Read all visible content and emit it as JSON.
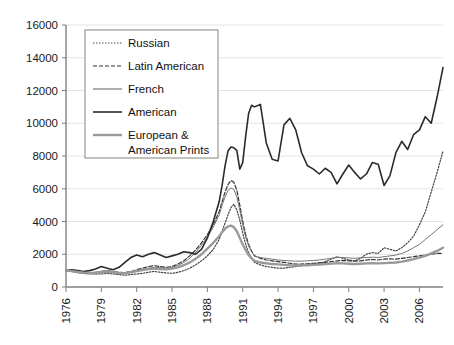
{
  "chart_data": {
    "type": "line",
    "title": "",
    "xlabel": "",
    "ylabel": "",
    "xlim": [
      1976,
      2008
    ],
    "ylim": [
      0,
      16000
    ],
    "grid": true,
    "legend_position": "top-left inside plot",
    "x_ticks": [
      "1976",
      "1979",
      "1982",
      "1985",
      "1988",
      "1991",
      "1994",
      "1997",
      "2000",
      "2003",
      "2006"
    ],
    "y_ticks": [
      "0",
      "2000",
      "4000",
      "6000",
      "8000",
      "10000",
      "12000",
      "14000",
      "16000"
    ],
    "x": [
      1976,
      1976.5,
      1977,
      1977.5,
      1978,
      1978.5,
      1979,
      1979.5,
      1980,
      1980.5,
      1981,
      1981.5,
      1982,
      1982.5,
      1983,
      1983.5,
      1984,
      1984.5,
      1985,
      1985.5,
      1986,
      1986.5,
      1987,
      1987.5,
      1988,
      1988.5,
      1989,
      1989.25,
      1989.5,
      1989.75,
      1990,
      1990.25,
      1990.5,
      1990.75,
      1991,
      1991.25,
      1991.5,
      1991.75,
      1992,
      1992.5,
      1993,
      1993.5,
      1994,
      1994.5,
      1995,
      1995.5,
      1996,
      1996.5,
      1997,
      1997.5,
      1998,
      1998.5,
      1999,
      1999.5,
      2000,
      2000.5,
      2001,
      2001.5,
      2002,
      2002.5,
      2003,
      2003.5,
      2004,
      2004.5,
      2005,
      2005.5,
      2006,
      2006.5,
      2007,
      2007.5,
      2008
    ],
    "series": [
      {
        "name": "Russian",
        "style": "dotted",
        "color": "#444444",
        "width": 1.2,
        "values": [
          1000,
          950,
          880,
          830,
          800,
          790,
          800,
          830,
          800,
          760,
          720,
          760,
          800,
          830,
          900,
          950,
          900,
          860,
          840,
          900,
          1000,
          1150,
          1350,
          1600,
          1900,
          2300,
          2900,
          3400,
          3900,
          4400,
          4850,
          5050,
          4700,
          4100,
          3300,
          2600,
          2100,
          1750,
          1500,
          1350,
          1250,
          1200,
          1150,
          1150,
          1200,
          1250,
          1300,
          1350,
          1400,
          1450,
          1550,
          1700,
          1850,
          1750,
          1650,
          1600,
          1750,
          2000,
          2100,
          2050,
          2400,
          2300,
          2200,
          2400,
          2700,
          3100,
          3800,
          4600,
          5800,
          7000,
          8300
        ]
      },
      {
        "name": "Latin American",
        "style": "dashed",
        "color": "#333333",
        "width": 1.2,
        "values": [
          1000,
          960,
          900,
          870,
          850,
          880,
          950,
          1000,
          950,
          900,
          880,
          950,
          1050,
          1150,
          1250,
          1300,
          1250,
          1200,
          1250,
          1400,
          1600,
          1900,
          2250,
          2700,
          3200,
          3800,
          4600,
          5200,
          5800,
          6250,
          6500,
          6400,
          5900,
          5000,
          4000,
          3200,
          2600,
          2200,
          1900,
          1750,
          1650,
          1600,
          1550,
          1500,
          1450,
          1400,
          1400,
          1420,
          1450,
          1480,
          1500,
          1550,
          1600,
          1620,
          1600,
          1580,
          1600,
          1650,
          1680,
          1650,
          1700,
          1720,
          1700,
          1750,
          1800,
          1850,
          1900,
          1950,
          2000,
          2050,
          2050
        ]
      },
      {
        "name": "French",
        "style": "solid-thin",
        "color": "#777777",
        "width": 1.0,
        "values": [
          1000,
          980,
          930,
          900,
          880,
          900,
          950,
          980,
          930,
          880,
          870,
          920,
          1000,
          1080,
          1150,
          1200,
          1180,
          1150,
          1200,
          1320,
          1500,
          1750,
          2100,
          2550,
          3050,
          3650,
          4400,
          5000,
          5500,
          5900,
          6050,
          5950,
          5500,
          4700,
          3800,
          3050,
          2500,
          2150,
          1900,
          1800,
          1750,
          1700,
          1650,
          1620,
          1600,
          1580,
          1580,
          1600,
          1620,
          1650,
          1700,
          1750,
          1800,
          1800,
          1780,
          1750,
          1780,
          1800,
          1820,
          1800,
          1850,
          1900,
          1950,
          2050,
          2200,
          2400,
          2600,
          2900,
          3200,
          3500,
          3800
        ]
      },
      {
        "name": "American",
        "style": "solid-thick",
        "color": "#2b2b2b",
        "width": 1.6,
        "values": [
          1000,
          1050,
          1000,
          950,
          1000,
          1100,
          1250,
          1150,
          1050,
          1200,
          1500,
          1800,
          1950,
          1850,
          2000,
          2100,
          1950,
          1800,
          1900,
          2000,
          2150,
          2100,
          2000,
          2300,
          3000,
          4000,
          5200,
          6200,
          7400,
          8300,
          8550,
          8500,
          8350,
          7200,
          7600,
          9200,
          10600,
          11100,
          11000,
          11150,
          8800,
          7800,
          7700,
          9900,
          10300,
          9600,
          8200,
          7400,
          7200,
          6900,
          7250,
          7000,
          6300,
          6900,
          7450,
          7000,
          6600,
          6900,
          7600,
          7500,
          6200,
          6800,
          8200,
          8900,
          8400,
          9300,
          9600,
          10400,
          10000,
          11600,
          13400
        ]
      },
      {
        "name": "European & American Prints",
        "style": "solid-thick-gray",
        "color": "#999999",
        "width": 2.4,
        "values": [
          1000,
          970,
          920,
          880,
          860,
          870,
          920,
          950,
          900,
          860,
          850,
          900,
          970,
          1030,
          1100,
          1130,
          1100,
          1080,
          1120,
          1200,
          1330,
          1500,
          1720,
          2000,
          2350,
          2700,
          3100,
          3350,
          3550,
          3700,
          3750,
          3650,
          3400,
          3000,
          2600,
          2250,
          1950,
          1750,
          1600,
          1500,
          1450,
          1400,
          1380,
          1350,
          1330,
          1320,
          1320,
          1330,
          1350,
          1370,
          1400,
          1430,
          1450,
          1440,
          1420,
          1400,
          1420,
          1440,
          1450,
          1440,
          1460,
          1480,
          1500,
          1550,
          1620,
          1700,
          1800,
          1900,
          2050,
          2200,
          2400
        ]
      }
    ]
  },
  "legend": {
    "items": [
      {
        "label": "Russian",
        "key": "russian"
      },
      {
        "label": "Latin American",
        "key": "latin-american"
      },
      {
        "label": "French",
        "key": "french"
      },
      {
        "label": "American",
        "key": "american"
      },
      {
        "label": "European &",
        "key": "european-prints-line1"
      },
      {
        "label": "American Prints",
        "key": "european-prints-line2"
      }
    ]
  },
  "colors": {
    "axis": "#808080",
    "grid": "#dddddd",
    "text": "#1a1a1a",
    "legend_border": "#9a9a8f",
    "russian": "#444444",
    "latin_american": "#333333",
    "french": "#777777",
    "american": "#2b2b2b",
    "prints": "#999999"
  }
}
